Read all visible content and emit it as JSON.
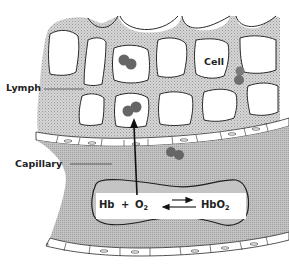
{
  "diagram": {
    "type": "biological illustration",
    "labels": {
      "lymph": "Lymph",
      "capillary": "Capillary",
      "cell": "Cell"
    },
    "equation": {
      "left_hb": "Hb",
      "plus": "+",
      "o2_main": "O",
      "o2_sub": "2",
      "right_hbo2_main": "HbO",
      "right_hbo2_sub": "2",
      "arrows": "reversible (forward short arrow right, long arrow left)"
    },
    "arrow": {
      "direction": "up",
      "from": "red blood cell in capillary",
      "to": "cell in lymph tissue"
    },
    "colors": {
      "stipple": "#bdbdbd",
      "capillary_fill": "#b5b5b5",
      "rbc_fill": "#c4c4c4",
      "oxygen_molecule": "#666666",
      "outline": "#2a2a2a",
      "cell_fill": "#ffffff"
    }
  }
}
